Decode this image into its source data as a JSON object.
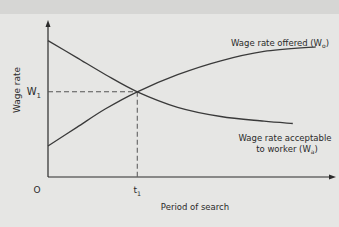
{
  "chart_data": {
    "type": "line",
    "title": "",
    "xlabel": "Period of search",
    "ylabel": "Wage rate",
    "origin_label": "O",
    "x_ticks": [
      {
        "label": "t",
        "sub": "1",
        "x": 0.31
      }
    ],
    "y_ticks": [
      {
        "label": "W",
        "sub": "1",
        "y": 0.55
      }
    ],
    "xlim": [
      0,
      1
    ],
    "ylim": [
      0,
      1
    ],
    "grid": false,
    "series": [
      {
        "name": "Wage rate offered (W_o)",
        "label_main": "Wage rate offered (W",
        "label_sub": "o",
        "label_end": ")",
        "shape": "increasing-concave",
        "points": [
          [
            0,
            0.2
          ],
          [
            0.1,
            0.32
          ],
          [
            0.2,
            0.44
          ],
          [
            0.31,
            0.55
          ],
          [
            0.45,
            0.66
          ],
          [
            0.6,
            0.75
          ],
          [
            0.75,
            0.81
          ],
          [
            0.93,
            0.84
          ]
        ]
      },
      {
        "name": "Wage rate acceptable to worker (W_a)",
        "label_line1": "Wage rate acceptable",
        "label_main": "to worker (W",
        "label_sub": "a",
        "label_end": ")",
        "shape": "decreasing-convex",
        "points": [
          [
            0,
            0.88
          ],
          [
            0.1,
            0.77
          ],
          [
            0.2,
            0.66
          ],
          [
            0.31,
            0.55
          ],
          [
            0.45,
            0.45
          ],
          [
            0.6,
            0.39
          ],
          [
            0.75,
            0.36
          ],
          [
            0.85,
            0.345
          ]
        ]
      }
    ],
    "annotations": [
      {
        "type": "dashed-guide",
        "at": {
          "x": 0.31,
          "y": 0.55
        },
        "text": "intersection of offered and acceptable wage at t1, W1"
      }
    ]
  }
}
